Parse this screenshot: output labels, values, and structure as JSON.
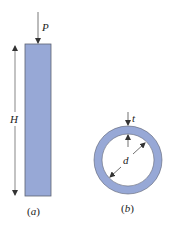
{
  "figure_a": {
    "load_label": "P",
    "height_label": "H",
    "caption": "(a)",
    "caption_letter": "a"
  },
  "figure_b": {
    "thickness_label": "t",
    "diameter_label": "d",
    "caption": "(b)",
    "caption_letter": "b"
  },
  "colors": {
    "fill": "#97a8d6",
    "stroke": "#5c6272",
    "line": "#333333"
  }
}
